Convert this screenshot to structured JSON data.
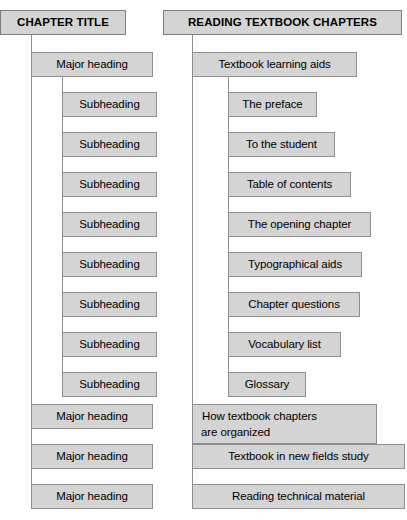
{
  "diagram": {
    "type": "two-column-hierarchy-comparison",
    "columns": [
      {
        "id": "generic",
        "header": "CHAPTER TITLE",
        "nodes": [
          {
            "label": "Major heading",
            "level": 1
          },
          {
            "label": "Subheading",
            "level": 2
          },
          {
            "label": "Subheading",
            "level": 2
          },
          {
            "label": "Subheading",
            "level": 2
          },
          {
            "label": "Subheading",
            "level": 2
          },
          {
            "label": "Subheading",
            "level": 2
          },
          {
            "label": "Subheading",
            "level": 2
          },
          {
            "label": "Subheading",
            "level": 2
          },
          {
            "label": "Subheading",
            "level": 2
          },
          {
            "label": "Major heading",
            "level": 1
          },
          {
            "label": "Major heading",
            "level": 1
          },
          {
            "label": "Major heading",
            "level": 1
          }
        ]
      },
      {
        "id": "example",
        "header": "READING TEXTBOOK CHAPTERS",
        "nodes": [
          {
            "label": "Textbook learning aids",
            "level": 1
          },
          {
            "label": "The preface",
            "level": 2
          },
          {
            "label": "To the student",
            "level": 2
          },
          {
            "label": "Table of contents",
            "level": 2
          },
          {
            "label": "The opening chapter",
            "level": 2
          },
          {
            "label": "Typographical aids",
            "level": 2
          },
          {
            "label": "Chapter questions",
            "level": 2
          },
          {
            "label": "Vocabulary list",
            "level": 2
          },
          {
            "label": "Glossary",
            "level": 2
          },
          {
            "label": "How textbook chapters are organized",
            "level": 1,
            "line1": "How textbook chapters",
            "line2": "are organized"
          },
          {
            "label": "Textbook in new fields study",
            "level": 1
          },
          {
            "label": "Reading technical material",
            "level": 1
          }
        ]
      }
    ],
    "colors": {
      "box_fill": "#d4d4d4",
      "box_border": "#8e8e8e",
      "line": "#8e8e8e",
      "text": "#000000",
      "background": "#ffffff"
    }
  }
}
